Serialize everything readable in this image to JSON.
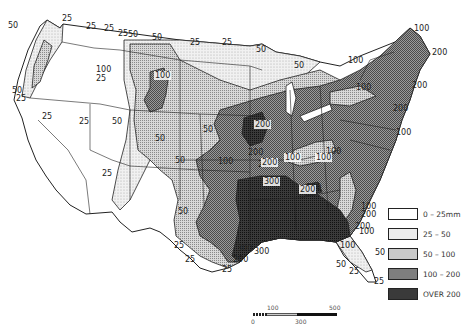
{
  "map": {
    "title": "",
    "region": "Contiguous United States",
    "colors": {
      "c0_25": "#ffffff",
      "c25_50": "#ececec",
      "c50_100": "#c9c9c9",
      "c100_200": "#7e7e7e",
      "cover200": "#3a3a3a",
      "lines": "#222222"
    },
    "contour_labels": [
      {
        "text": "50",
        "x": 8,
        "y": 28
      },
      {
        "text": "25",
        "x": 62,
        "y": 21
      },
      {
        "text": "25",
        "x": 86,
        "y": 29
      },
      {
        "text": "25",
        "x": 104,
        "y": 31
      },
      {
        "text": "25",
        "x": 118,
        "y": 36
      },
      {
        "text": "50",
        "x": 128,
        "y": 37
      },
      {
        "text": "50",
        "x": 152,
        "y": 40
      },
      {
        "text": "25",
        "x": 190,
        "y": 45
      },
      {
        "text": "25",
        "x": 222,
        "y": 45
      },
      {
        "text": "50",
        "x": 256,
        "y": 52
      },
      {
        "text": "100",
        "x": 96,
        "y": 72
      },
      {
        "text": "25",
        "x": 96,
        "y": 81
      },
      {
        "text": "50",
        "x": 294,
        "y": 68
      },
      {
        "text": "100",
        "x": 348,
        "y": 63
      },
      {
        "text": "100",
        "x": 414,
        "y": 31
      },
      {
        "text": "200",
        "x": 432,
        "y": 55
      },
      {
        "text": "100",
        "x": 356,
        "y": 90
      },
      {
        "text": "200",
        "x": 412,
        "y": 88
      },
      {
        "text": "200",
        "x": 393,
        "y": 111
      },
      {
        "text": "100",
        "x": 396,
        "y": 135
      },
      {
        "text": "50",
        "x": 12,
        "y": 93
      },
      {
        "text": "25",
        "x": 16,
        "y": 101
      },
      {
        "text": "25",
        "x": 42,
        "y": 119
      },
      {
        "text": "25",
        "x": 79,
        "y": 124
      },
      {
        "text": "50",
        "x": 112,
        "y": 124
      },
      {
        "text": "50",
        "x": 203,
        "y": 132
      },
      {
        "text": "50",
        "x": 155,
        "y": 141
      },
      {
        "text": "200",
        "x": 248,
        "y": 155
      },
      {
        "text": "100",
        "x": 326,
        "y": 154
      },
      {
        "text": "100",
        "x": 218,
        "y": 164
      },
      {
        "text": "50",
        "x": 175,
        "y": 163
      },
      {
        "text": "200",
        "x": 258,
        "y": 167
      },
      {
        "text": "25",
        "x": 102,
        "y": 176
      },
      {
        "text": "300",
        "x": 260,
        "y": 183
      },
      {
        "text": "200",
        "x": 306,
        "y": 190
      },
      {
        "text": "50",
        "x": 178,
        "y": 214
      },
      {
        "text": "100",
        "x": 361,
        "y": 209
      },
      {
        "text": "200",
        "x": 361,
        "y": 217
      },
      {
        "text": "200",
        "x": 355,
        "y": 229
      },
      {
        "text": "100",
        "x": 359,
        "y": 234
      },
      {
        "text": "25",
        "x": 174,
        "y": 248
      },
      {
        "text": "300",
        "x": 237,
        "y": 251
      },
      {
        "text": "300",
        "x": 254,
        "y": 254
      },
      {
        "text": "200",
        "x": 233,
        "y": 262
      },
      {
        "text": "100",
        "x": 340,
        "y": 248
      },
      {
        "text": "50",
        "x": 375,
        "y": 255
      },
      {
        "text": "50",
        "x": 336,
        "y": 267
      },
      {
        "text": "25",
        "x": 185,
        "y": 262
      },
      {
        "text": "25",
        "x": 349,
        "y": 274
      },
      {
        "text": "25",
        "x": 374,
        "y": 284
      },
      {
        "text": "25",
        "x": 222,
        "y": 272
      }
    ],
    "highlight_labels": [
      {
        "text": "200",
        "x": 255,
        "y": 127
      },
      {
        "text": "200",
        "x": 262,
        "y": 165
      },
      {
        "text": "300",
        "x": 264,
        "y": 184
      },
      {
        "text": "100",
        "x": 316,
        "y": 160
      },
      {
        "text": "200",
        "x": 300,
        "y": 192
      },
      {
        "text": "100",
        "x": 155,
        "y": 78
      },
      {
        "text": "100",
        "x": 285,
        "y": 160
      }
    ]
  },
  "legend": {
    "items": [
      {
        "label": "0 – 25mm",
        "color": "#ffffff"
      },
      {
        "label": "25 – 50",
        "color": "#ececec"
      },
      {
        "label": "50 – 100",
        "color": "#c9c9c9"
      },
      {
        "label": "100 – 200",
        "color": "#7e7e7e"
      },
      {
        "label": "OVER 200",
        "color": "#3a3a3a"
      }
    ]
  },
  "scale_bar": {
    "ticks_top": [
      "100",
      "500"
    ],
    "ticks_bottom": [
      "0",
      "300"
    ]
  }
}
